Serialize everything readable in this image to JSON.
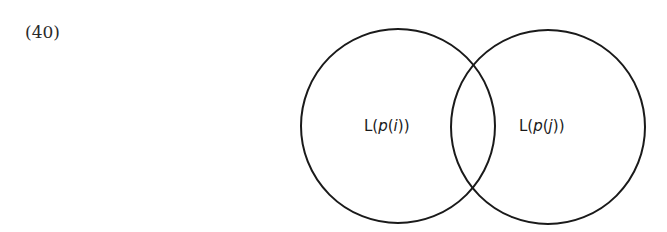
{
  "example_number": "(40)",
  "diagram": {
    "type": "venn",
    "sets": [
      {
        "label_prefix": "L(",
        "label_var": "p",
        "label_mid": "(",
        "label_index": "i",
        "label_suffix": "))",
        "full_label": "L(p(i))",
        "cx": 398,
        "cy": 126,
        "r": 97
      },
      {
        "label_prefix": "L(",
        "label_var": "p",
        "label_mid": "(",
        "label_index": "j",
        "label_suffix": "))",
        "full_label": "L(p(j))",
        "cx": 548,
        "cy": 127,
        "r": 97
      }
    ],
    "stroke_color": "#1a1a1a",
    "background": "#ffffff"
  }
}
